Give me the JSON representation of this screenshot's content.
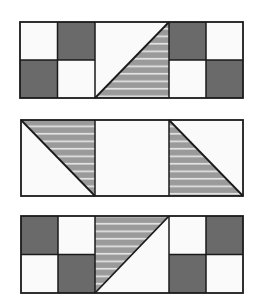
{
  "diagram": {
    "colors": {
      "background": "#ffffff",
      "light": "#fafafa",
      "dark": "#6a6a6a",
      "striped_base": "#9a9a9a",
      "stripe_line": "#e8e8e8",
      "outline": "#1a1a1a"
    },
    "strips": [
      {
        "id": "strip-top",
        "units": [
          "four-patch (light, dark / dark, light)",
          "half-square triangle (light upper-left, striped lower-right, diagonal bottom-left to top-right)",
          "four-patch (dark, light / light, dark)"
        ]
      },
      {
        "id": "strip-middle",
        "units": [
          "half-square triangle (striped upper-right, light lower-left, diagonal top-left to bottom-right)",
          "plain light square",
          "half-square triangle (striped lower-left, light upper-right, diagonal top-left to bottom-right)"
        ]
      },
      {
        "id": "strip-bottom",
        "units": [
          "four-patch (dark, light / light, dark)",
          "half-square triangle (striped upper-left, light lower-right, diagonal bottom-left to top-right)",
          "four-patch (light, dark / dark, light)"
        ]
      }
    ]
  }
}
